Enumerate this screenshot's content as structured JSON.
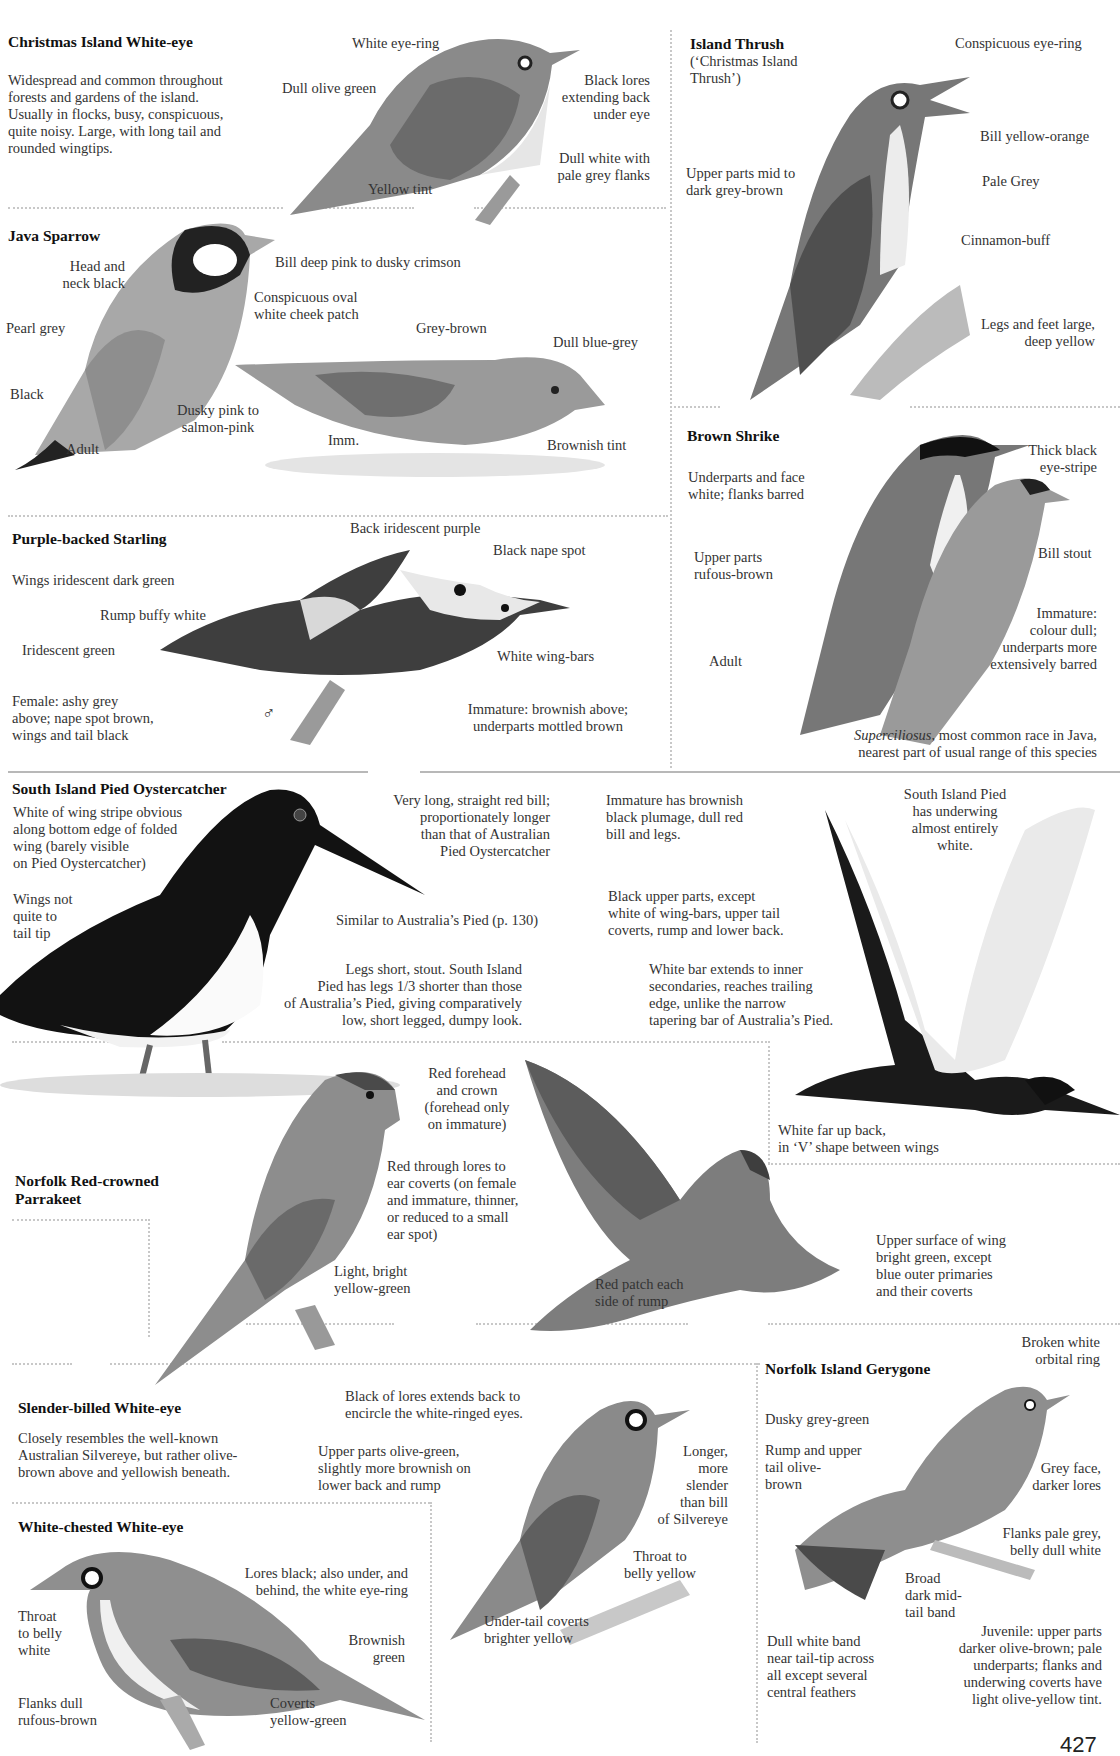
{
  "page_number": "427",
  "species": {
    "christmas_white_eye": {
      "title": "Christmas Island White-eye",
      "description": [
        "Widespread and common throughout",
        "forests and gardens of the island.",
        "Usually in flocks, busy, conspicuous,",
        "quite noisy.  Large, with long tail and",
        "rounded wingtips."
      ],
      "labels": {
        "eye_ring": "White eye-ring",
        "olive": "Dull olive green",
        "lores": [
          "Black lores",
          "extending back",
          "under eye"
        ],
        "flanks": [
          "Dull white with",
          "pale grey flanks"
        ],
        "yellow": "Yellow tint"
      }
    },
    "island_thrush": {
      "title": "Island Thrush",
      "subtitle": [
        "(‘Christmas Island",
        "Thrush’)"
      ],
      "labels": {
        "eye_ring": "Conspicuous eye-ring",
        "bill": "Bill yellow-orange",
        "pale": "Pale Grey",
        "cinnamon": "Cinnamon-buff",
        "upper": [
          "Upper parts mid to",
          "dark grey-brown"
        ],
        "legs": [
          "Legs and feet large,",
          "deep yellow"
        ]
      }
    },
    "java_sparrow": {
      "title": "Java Sparrow",
      "labels": {
        "head": [
          "Head and",
          "neck black"
        ],
        "bill": "Bill deep pink to dusky crimson",
        "cheek": [
          "Conspicuous oval",
          "white cheek patch"
        ],
        "pearl": "Pearl grey",
        "black": "Black",
        "dusky": [
          "Dusky pink to",
          "salmon-pink"
        ],
        "adult": "Adult",
        "grey_brown": "Grey-brown",
        "blue_grey": "Dull blue-grey",
        "imm": "Imm.",
        "brownish": "Brownish tint"
      }
    },
    "brown_shrike": {
      "title": "Brown Shrike",
      "labels": {
        "under": [
          "Underparts and face",
          "white; flanks barred"
        ],
        "stripe": [
          "Thick black",
          "eye-stripe"
        ],
        "upper": [
          "Upper parts",
          "rufous-brown"
        ],
        "bill": "Bill stout",
        "imm": [
          "Immature:",
          "colour dull;",
          "underparts more",
          "extensively barred"
        ],
        "adult": "Adult"
      },
      "note_italic": "Superciliosus",
      "note": [
        ", most common race in Java,",
        "nearest part of usual range of this species"
      ]
    },
    "purple_starling": {
      "title": "Purple-backed Starling",
      "labels": {
        "back": "Back iridescent purple",
        "nape": "Black nape spot",
        "wings": "Wings iridescent dark green",
        "rump": "Rump buffy white",
        "green": "Iridescent green",
        "bars": "White wing-bars",
        "female": [
          "Female: ashy grey",
          "above; nape spot brown,",
          "wings and tail black"
        ],
        "male_symbol": "♂",
        "imm": [
          "Immature: brownish above;",
          "underparts mottled brown"
        ]
      }
    },
    "oystercatcher": {
      "title": "South Island Pied Oystercatcher",
      "labels": {
        "stripe": [
          "White of wing stripe obvious",
          "along bottom edge of folded",
          "wing (barely visible",
          "on Pied Oystercatcher)"
        ],
        "wings": [
          "Wings not",
          "quite to",
          "tail tip"
        ],
        "bill": [
          "Very long, straight red bill;",
          "proportionately longer",
          "than that of Australian",
          "Pied Oystercatcher"
        ],
        "similar": "Similar to Australia’s Pied (p. 130)",
        "legs": [
          "Legs short, stout.  South Island",
          "Pied has legs 1/3 shorter than those",
          "of Australia’s Pied, giving comparatively",
          "low, short legged, dumpy look."
        ],
        "imm": [
          "Immature has brownish",
          "black plumage, dull red",
          "bill and legs."
        ],
        "underwing": [
          "South Island Pied",
          "has underwing",
          "almost entirely",
          "white."
        ],
        "upper": [
          "Black upper parts, except",
          "white of wing-bars, upper tail",
          "coverts, rump and lower back."
        ],
        "bar": [
          "White bar extends to inner",
          "secondaries, reaches trailing",
          "edge, unlike the narrow",
          "tapering bar of Australia’s Pied."
        ],
        "back": [
          "White far up back,",
          "in ‘V’ shape between wings"
        ]
      }
    },
    "parrakeet": {
      "title": [
        "Norfolk Red-crowned",
        "Parrakeet"
      ],
      "labels": {
        "forehead": [
          "Red forehead",
          "and crown",
          "(forehead only",
          "on immature)"
        ],
        "lores": [
          "Red through lores to",
          "ear coverts (on female",
          "and immature, thinner,",
          "or reduced to a small",
          "ear spot)"
        ],
        "light": [
          "Light, bright",
          "yellow-green"
        ],
        "rump": [
          "Red patch each",
          "side of rump"
        ],
        "wing": [
          "Upper surface of wing",
          "bright green, except",
          "blue outer primaries",
          "and their coverts"
        ]
      }
    },
    "slender_white_eye": {
      "title": "Slender-billed White-eye",
      "description": [
        "Closely resembles the well-known",
        "Australian Silvereye, but rather olive-",
        "brown above and yellowish beneath."
      ],
      "labels": {
        "lores": [
          "Black of lores extends back to",
          "encircle the white-ringed eyes."
        ],
        "upper": [
          "Upper parts olive-green,",
          "slightly more brownish on",
          "lower back and rump"
        ],
        "bill": [
          "Longer,",
          "more",
          "slender",
          "than bill",
          "of Silvereye"
        ],
        "throat": [
          "Throat to",
          "belly yellow"
        ],
        "under": [
          "Under-tail coverts",
          "brighter yellow"
        ]
      }
    },
    "white_chested": {
      "title": "White-chested White-eye",
      "labels": {
        "lores": [
          "Lores black; also under, and",
          "behind, the white eye-ring"
        ],
        "throat": [
          "Throat",
          "to belly",
          "white"
        ],
        "brownish": [
          "Brownish",
          "green"
        ],
        "flanks": [
          "Flanks dull",
          "rufous-brown"
        ],
        "coverts": [
          "Coverts",
          "yellow-green"
        ]
      }
    },
    "gerygone": {
      "title": "Norfolk Island Gerygone",
      "labels": {
        "orbital": [
          "Broken white",
          "orbital ring"
        ],
        "dusky": "Dusky grey-green",
        "rump": [
          "Rump and upper",
          "tail olive-",
          "brown"
        ],
        "face": [
          "Grey face,",
          "darker lores"
        ],
        "flanks": [
          "Flanks pale grey,",
          "belly dull white"
        ],
        "band": [
          "Broad",
          "dark mid-",
          "tail band"
        ],
        "white_band": [
          "Dull white band",
          "near tail-tip across",
          "all except several",
          "central feathers"
        ],
        "juvenile": [
          "Juvenile: upper parts",
          "darker olive-brown; pale",
          "underparts; flanks and",
          "underwing coverts have",
          "light olive-yellow tint."
        ]
      }
    }
  }
}
